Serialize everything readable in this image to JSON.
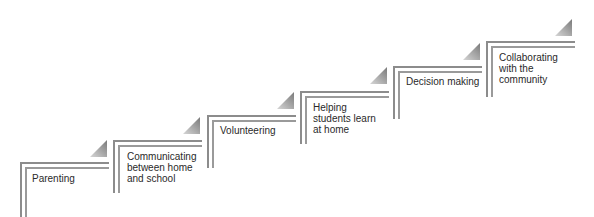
{
  "diagram": {
    "type": "staircase",
    "steps": [
      {
        "label": "Parenting",
        "lines": [
          "Parenting"
        ]
      },
      {
        "label": "Communicating between home and school",
        "lines": [
          "Communicating",
          "between home",
          "and school"
        ]
      },
      {
        "label": "Volunteering",
        "lines": [
          "Volunteering"
        ]
      },
      {
        "label": "Helping students learn at home",
        "lines": [
          "Helping",
          "students learn",
          "at home"
        ]
      },
      {
        "label": "Decision making",
        "lines": [
          "Decision making"
        ]
      },
      {
        "label": "Collaborating with the community",
        "lines": [
          "Collaborating",
          "with the",
          "community"
        ]
      }
    ],
    "colors": {
      "border_dark": "#8c8c8c",
      "border_light": "#9a9a9a",
      "triangle_dark": "#7a7a7a",
      "triangle_light": "#d6d6d6",
      "text": "#2a2a2a"
    }
  }
}
